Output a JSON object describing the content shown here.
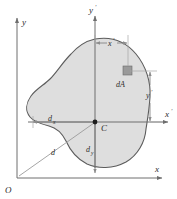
{
  "figure": {
    "labels": {
      "y_axis": "y",
      "x_axis": "x",
      "origin": "O",
      "y_prime_axis": "y",
      "y_prime_axis_prime": "′",
      "x_prime_axis": "x",
      "x_prime_axis_prime": "′",
      "centroid": "C",
      "element": "dA",
      "dim_x_prime": "x",
      "dim_x_prime_mark": "′",
      "dim_y_prime": "y",
      "dim_y_prime_mark": "′",
      "dist_dx": "d",
      "dist_dx_sub": "x",
      "dist_dy": "d",
      "dist_dy_sub": "y",
      "dist_d": "d"
    },
    "colors": {
      "area_fill": "#dedede",
      "area_outline": "#5c5c5c",
      "axis": "#6e6e6e",
      "dimension": "#7a7a7a",
      "element_fill": "#9a9a9a",
      "text": "#2b2b2b",
      "background": "#ffffff"
    },
    "geometry": {
      "centroid_px": [
        95,
        122
      ],
      "origin_px": [
        17,
        178
      ],
      "element_px": [
        127,
        71
      ],
      "x_prime_value_px": 32,
      "y_prime_value_px": 51
    }
  }
}
